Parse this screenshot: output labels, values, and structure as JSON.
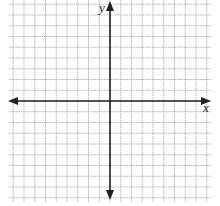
{
  "diagram": {
    "type": "coordinate-plane",
    "axes": {
      "x_label": "x",
      "y_label": "y"
    },
    "grid": {
      "columns_left_of_y_axis": 9,
      "columns_right_of_y_axis": 9,
      "rows_above_x_axis": 9,
      "rows_below_x_axis": 9,
      "line_color": "#b5b5b5",
      "axis_color": "#222222"
    }
  }
}
